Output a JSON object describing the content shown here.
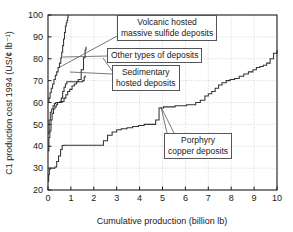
{
  "chart_data": {
    "type": "line",
    "title": "",
    "subtitle": "",
    "xlabel": "Cumulative production (billion lb)",
    "ylabel": "C1 production cost 1994 (US/¢ lb⁻¹)",
    "xlim": [
      0,
      10
    ],
    "ylim": [
      20,
      100
    ],
    "xticks": [
      "0",
      "1",
      "2",
      "3",
      "4",
      "5",
      "6",
      "7",
      "8",
      "9",
      "10"
    ],
    "yticks": [
      "20",
      "30",
      "40",
      "50",
      "60",
      "70",
      "80",
      "90",
      "100"
    ],
    "grid": true,
    "grid_style": "dotted",
    "legend": "annotated-callouts",
    "legend_position": "inside-plot",
    "series": [
      {
        "name": "Porphyry copper deposits",
        "step": "post",
        "x": [
          0.0,
          0.03,
          0.06,
          0.1,
          0.16,
          0.22,
          0.3,
          0.38,
          0.46,
          0.55,
          0.62,
          0.7,
          0.8,
          0.95,
          1.15,
          1.35,
          1.55,
          1.8,
          2.05,
          2.3,
          2.42,
          2.6,
          2.8,
          3.0,
          3.2,
          3.45,
          3.7,
          3.95,
          4.2,
          4.45,
          4.7,
          4.85,
          5.05,
          5.3,
          5.55,
          5.8,
          6.05,
          6.25,
          6.45,
          6.65,
          6.85,
          7.0,
          7.15,
          7.3,
          7.45,
          7.6,
          7.78,
          7.95,
          8.15,
          8.35,
          8.55,
          8.75,
          8.95,
          9.1,
          9.25,
          9.4,
          9.55,
          9.7,
          9.85,
          10.0
        ],
        "y": [
          24.0,
          27.0,
          29.5,
          30.0,
          30.0,
          30.0,
          30.5,
          33.0,
          35.5,
          38.5,
          40.3,
          40.5,
          40.5,
          40.5,
          40.5,
          40.5,
          40.5,
          40.5,
          40.5,
          40.5,
          42.5,
          45.0,
          46.5,
          47.5,
          48.0,
          48.5,
          49.0,
          49.5,
          50.0,
          50.0,
          52.0,
          57.5,
          58.0,
          58.0,
          58.5,
          58.5,
          59.0,
          59.0,
          60.0,
          61.0,
          63.0,
          64.0,
          65.0,
          66.5,
          68.0,
          69.0,
          70.0,
          70.5,
          71.0,
          72.0,
          73.0,
          74.0,
          75.0,
          76.0,
          76.5,
          77.0,
          78.0,
          80.0,
          82.5,
          84.0
        ],
        "annotation": "Porphyry copper deposits"
      },
      {
        "name": "Sedimentary hosted deposits",
        "step": "post",
        "x": [
          0.0,
          0.04,
          0.08,
          0.13,
          0.18,
          0.24,
          0.3,
          0.36,
          0.42,
          0.48,
          0.55,
          0.62,
          0.7,
          0.78,
          0.86,
          0.95,
          1.05,
          1.15,
          1.25,
          1.35,
          1.45,
          1.52,
          1.58,
          1.62
        ],
        "y": [
          38.0,
          44.0,
          47.0,
          52.0,
          55.0,
          57.0,
          58.0,
          59.0,
          60.0,
          60.0,
          60.0,
          60.5,
          62.0,
          63.5,
          65.0,
          66.0,
          67.5,
          68.5,
          69.5,
          69.5,
          69.5,
          70.0,
          71.5,
          72.5
        ],
        "annotation": "Sedimentary hosted deposits"
      },
      {
        "name": "Other types of deposits",
        "step": "post",
        "x": [
          0.0,
          0.05,
          0.1,
          0.16,
          0.22,
          0.28,
          0.34,
          0.4,
          0.46,
          0.52,
          0.58,
          0.64,
          0.7,
          0.76,
          0.82,
          0.9,
          1.0,
          1.1,
          1.2,
          1.32,
          1.45,
          1.55,
          1.62,
          1.66
        ],
        "y": [
          46.0,
          52.0,
          55.5,
          57.0,
          58.5,
          59.5,
          60.0,
          60.0,
          60.0,
          60.5,
          62.0,
          65.0,
          67.0,
          68.5,
          69.5,
          69.5,
          69.5,
          69.5,
          69.5,
          70.5,
          75.0,
          80.5,
          84.0,
          85.5
        ],
        "annotation": "Other types of deposits"
      },
      {
        "name": "Volcanic hosted massive sulfide deposits",
        "step": "post",
        "x": [
          0.0,
          0.04,
          0.09,
          0.14,
          0.2,
          0.26,
          0.32,
          0.38,
          0.44,
          0.5,
          0.56,
          0.6,
          0.64,
          0.68,
          0.72,
          0.76,
          0.8,
          0.83,
          0.86,
          0.88
        ],
        "y": [
          60.0,
          62.0,
          64.5,
          66.5,
          68.5,
          70.5,
          72.5,
          74.0,
          76.0,
          78.0,
          80.5,
          83.0,
          86.0,
          89.0,
          92.0,
          95.0,
          96.5,
          97.5,
          99.0,
          100.0
        ],
        "annotation": "Volcanic hosted massive sulfide deposits"
      }
    ]
  },
  "annotations": {
    "volcanic": {
      "line1": "Volcanic hosted",
      "line2": "massive sulfide deposits"
    },
    "other": {
      "line1": "Other types of deposits",
      "line2": ""
    },
    "sedimentary": {
      "line1": "Sedimentary",
      "line2": "hosted deposits"
    },
    "porphyry": {
      "line1": "Porphyry",
      "line2": "copper deposits"
    }
  },
  "colors": {
    "axis": "#1a1a1a",
    "curve": "#333333",
    "grid": "#bbbbbb",
    "box_border": "#555555",
    "background": "#ffffff"
  }
}
